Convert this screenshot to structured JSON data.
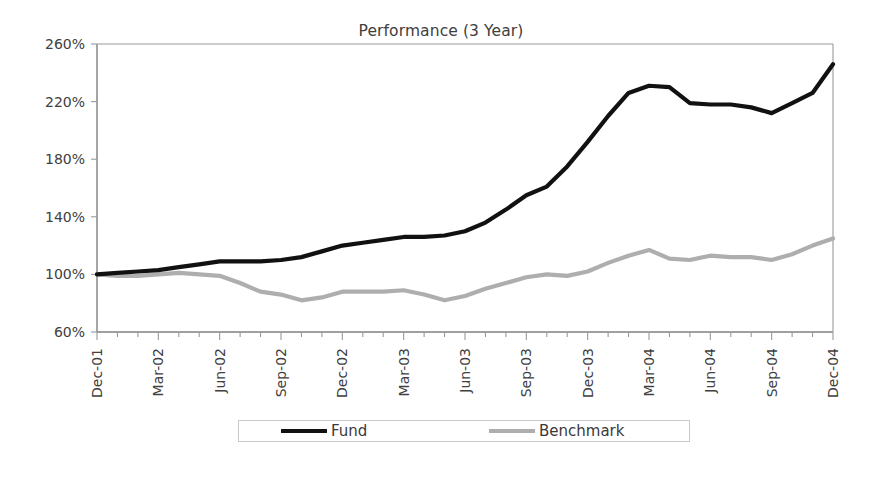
{
  "chart_data": {
    "type": "line",
    "title": "Performance (3 Year)",
    "xlabel": "",
    "ylabel": "",
    "ylim": [
      60,
      260
    ],
    "ytick_labels": [
      "60%",
      "100%",
      "140%",
      "180%",
      "220%",
      "260%"
    ],
    "ytick_values": [
      60,
      100,
      140,
      180,
      220,
      260
    ],
    "grid": false,
    "legend_position": "bottom",
    "x": [
      "Dec-01",
      "Jan-02",
      "Feb-02",
      "Mar-02",
      "Apr-02",
      "May-02",
      "Jun-02",
      "Jul-02",
      "Aug-02",
      "Sep-02",
      "Oct-02",
      "Nov-02",
      "Dec-02",
      "Jan-03",
      "Feb-03",
      "Mar-03",
      "Apr-03",
      "May-03",
      "Jun-03",
      "Jul-03",
      "Aug-03",
      "Sep-03",
      "Oct-03",
      "Nov-03",
      "Dec-03",
      "Jan-04",
      "Feb-04",
      "Mar-04",
      "Apr-04",
      "May-04",
      "Jun-04",
      "Jul-04",
      "Aug-04",
      "Sep-04",
      "Oct-04",
      "Nov-04",
      "Dec-04"
    ],
    "xtick_labels": [
      "Dec-01",
      "Mar-02",
      "Jun-02",
      "Sep-02",
      "Dec-02",
      "Mar-03",
      "Jun-03",
      "Sep-03",
      "Dec-03",
      "Mar-04",
      "Jun-04",
      "Sep-04",
      "Dec-04"
    ],
    "xtick_indices": [
      0,
      3,
      6,
      9,
      12,
      15,
      18,
      21,
      24,
      27,
      30,
      33,
      36
    ],
    "series": [
      {
        "name": "Fund",
        "color": "#111111",
        "values": [
          100,
          101,
          102,
          103,
          105,
          107,
          109,
          109,
          109,
          110,
          112,
          116,
          120,
          122,
          124,
          126,
          126,
          127,
          130,
          136,
          145,
          155,
          161,
          175,
          192,
          210,
          226,
          231,
          230,
          219,
          218,
          218,
          216,
          212,
          219,
          226,
          246
        ]
      },
      {
        "name": "Benchmark",
        "color": "#aeaeae",
        "values": [
          100,
          99,
          99,
          100,
          101,
          100,
          99,
          94,
          88,
          86,
          82,
          84,
          88,
          88,
          88,
          89,
          86,
          82,
          85,
          90,
          94,
          98,
          100,
          99,
          102,
          108,
          113,
          117,
          111,
          110,
          113,
          112,
          112,
          110,
          114,
          120,
          125
        ]
      }
    ]
  },
  "legend": {
    "items": [
      {
        "label": "Fund",
        "color": "#111111"
      },
      {
        "label": "Benchmark",
        "color": "#aeaeae"
      }
    ]
  }
}
